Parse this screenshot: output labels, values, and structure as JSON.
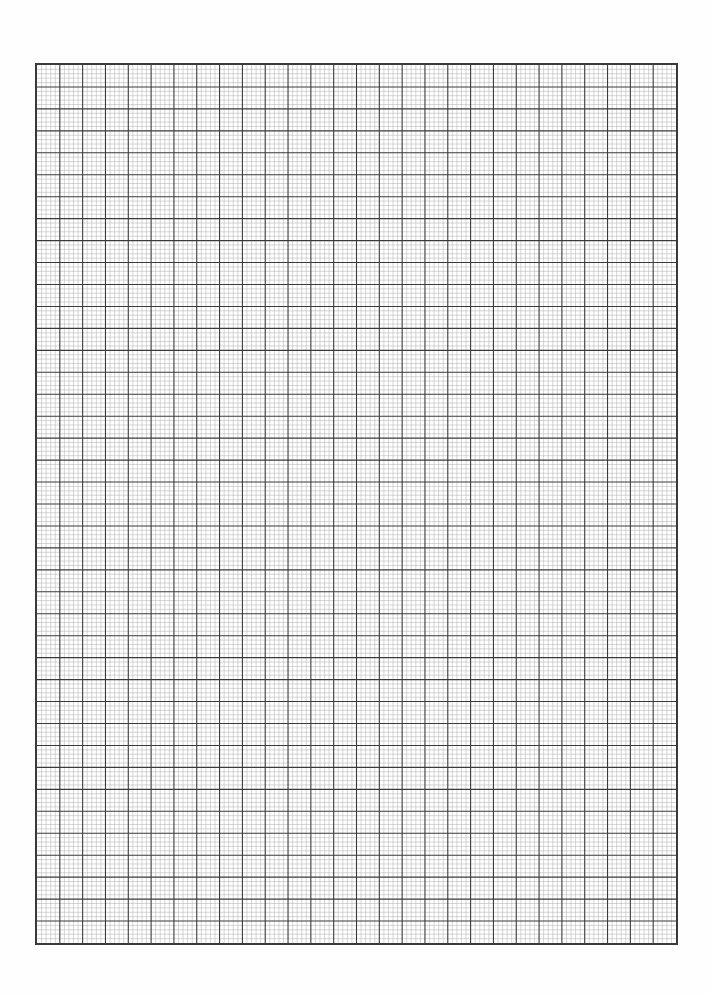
{
  "document": {
    "type": "graph-paper-sheet",
    "paper_color": "#ffffff",
    "grid": {
      "left": 35,
      "top": 63,
      "width": 643,
      "height": 882,
      "major_columns": 28,
      "major_rows": 40,
      "minor_per_major": 5,
      "major_line_color": "#3a3a3a",
      "minor_line_color": "#b4b4b4",
      "major_line_width": 1.1,
      "minor_line_width": 0.55
    }
  }
}
